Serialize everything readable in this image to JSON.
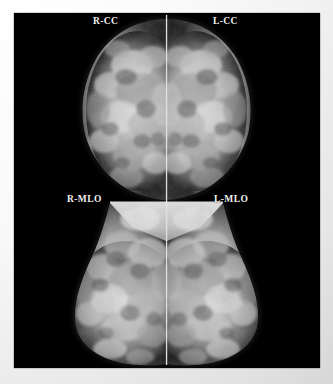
{
  "document": {
    "kind": "mammogram-screening-study",
    "background_color": "#ffffff",
    "plate_color": "#000000",
    "label_color": "#f2f2f2"
  },
  "study": {
    "layout": "2x2 mirrored hanging protocol",
    "views": [
      {
        "id": "r-cc",
        "label": "R-CC",
        "laterality": "R",
        "projection": "CC",
        "quadrant": "top-left"
      },
      {
        "id": "l-cc",
        "label": "L-CC",
        "laterality": "L",
        "projection": "CC",
        "quadrant": "top-right"
      },
      {
        "id": "r-mlo",
        "label": "R-MLO",
        "laterality": "R",
        "projection": "MLO",
        "quadrant": "bottom-left"
      },
      {
        "id": "l-mlo",
        "label": "L-MLO",
        "laterality": "L",
        "projection": "MLO",
        "quadrant": "bottom-right"
      }
    ]
  },
  "render": {
    "plate": {
      "x": 14,
      "y": 13,
      "w": 306,
      "h": 355
    },
    "midline_x": 152.5,
    "cc_band": {
      "top": 2,
      "bottom": 188
    },
    "mlo_band": {
      "top": 188,
      "bottom": 352
    },
    "tissue": {
      "blob_count": 560,
      "seed": 20240517,
      "skin_line": "#6a6a6a",
      "parenchyma_bright": "#f4f4f4",
      "parenchyma_mid": "#9a9a9a",
      "fat_dark": "#2a2a2a",
      "pectoral": "#d8d8d8"
    }
  }
}
